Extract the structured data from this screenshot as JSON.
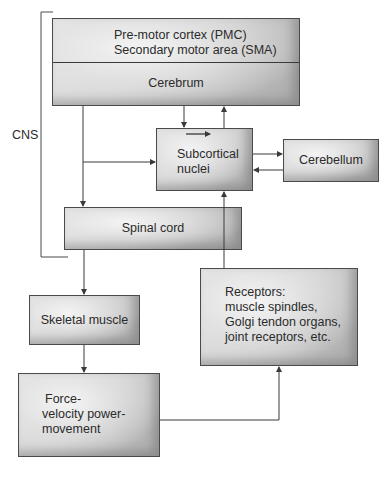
{
  "diagram": {
    "type": "flowchart",
    "bracket_label": "CNS",
    "nodes": {
      "cortex": {
        "line1": "Pre-motor cortex (PMC)",
        "line2": "Secondary motor area (SMA)",
        "section_label": "Cerebrum"
      },
      "subcortical": {
        "line1": "Subcortical",
        "line2": "nuclei"
      },
      "cerebellum": {
        "label": "Cerebellum"
      },
      "spinal_cord": {
        "label": "Spinal cord"
      },
      "skeletal_muscle": {
        "label": "Skeletal muscle"
      },
      "force": {
        "line1": "Force-",
        "line2": "velocity power-",
        "line3": "movement"
      },
      "receptors": {
        "line1": "Receptors:",
        "line2": "muscle spindles,",
        "line3": "Golgi tendon organs,",
        "line4": "joint receptors, etc."
      }
    },
    "edges": [
      {
        "from": "Cerebrum",
        "to": "Subcortical nuclei"
      },
      {
        "from": "Subcortical nuclei",
        "to": "Cerebrum"
      },
      {
        "from": "Cerebrum",
        "to": "Spinal cord"
      },
      {
        "from": "Cerebrum",
        "to": "Subcortical nuclei",
        "via": "branch"
      },
      {
        "from": "Subcortical nuclei",
        "to": "Cerebellum"
      },
      {
        "from": "Cerebellum",
        "to": "Subcortical nuclei"
      },
      {
        "from": "Spinal cord",
        "to": "Skeletal muscle"
      },
      {
        "from": "Skeletal muscle",
        "to": "Force-velocity power-movement"
      },
      {
        "from": "Force-velocity power-movement",
        "to": "Receptors"
      },
      {
        "from": "Receptors",
        "to": "Subcortical nuclei"
      }
    ],
    "colors": {
      "line": "#3a3a3a",
      "box_light": "#e6e6e6",
      "box_dark": "#a9a9a9",
      "border": "#4a4a4a"
    }
  }
}
